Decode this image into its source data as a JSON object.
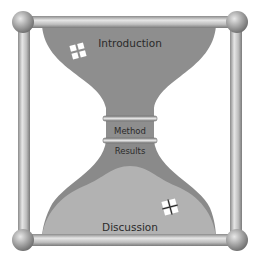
{
  "diagram": {
    "type": "hourglass-model",
    "sections": {
      "introduction": "Introduction",
      "method": "Method",
      "results": "Results",
      "discussion": "Discussion"
    },
    "colors": {
      "background": "#ffffff",
      "funnel_dark": "#8c8c8c",
      "funnel_light": "#b4b4b4",
      "frame": "#b0b0b0",
      "text": "#2a2a2a"
    },
    "icons": [
      "sparkle-icon-top",
      "sparkle-icon-bottom"
    ]
  }
}
